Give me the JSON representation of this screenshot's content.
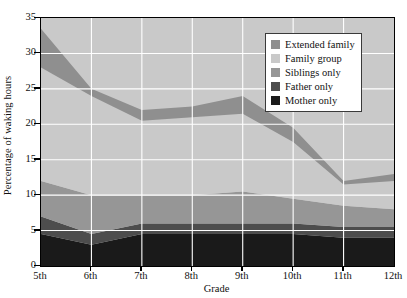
{
  "chart_data": {
    "type": "area",
    "stacked": true,
    "title": "",
    "xlabel": "Grade",
    "ylabel": "Percentage of waking hours",
    "categories": [
      "5th",
      "6th",
      "7th",
      "8th",
      "9th",
      "10th",
      "11th",
      "12th"
    ],
    "ylim": [
      0,
      35
    ],
    "yticks": [
      0,
      5,
      10,
      15,
      20,
      25,
      30,
      35
    ],
    "grid": true,
    "grid_color": "#ffffff",
    "plot_background": "#c9c9c9",
    "legend_position": "top-right",
    "series": [
      {
        "name": "Mother only",
        "color": "#1a1a1a",
        "values": [
          4.5,
          3.0,
          4.5,
          4.5,
          4.5,
          4.5,
          4.0,
          4.0
        ]
      },
      {
        "name": "Father only",
        "color": "#4d4d4d",
        "values": [
          2.5,
          1.5,
          1.5,
          1.5,
          1.5,
          1.5,
          1.5,
          1.5
        ]
      },
      {
        "name": "Siblings only",
        "color": "#969696",
        "values": [
          5.0,
          5.5,
          4.0,
          4.0,
          4.5,
          3.5,
          3.0,
          2.5
        ]
      },
      {
        "name": "Family group",
        "color": "#c9c9c9",
        "values": [
          16.0,
          14.0,
          10.5,
          11.0,
          11.0,
          8.0,
          3.0,
          4.0
        ]
      },
      {
        "name": "Extended family",
        "color": "#8f8f8f",
        "values": [
          5.5,
          1.0,
          1.5,
          1.5,
          2.5,
          2.0,
          0.5,
          1.0
        ]
      }
    ],
    "cumulative_tops": {
      "Mother only": [
        4.5,
        3.0,
        4.5,
        4.5,
        4.5,
        4.5,
        4.0,
        4.0
      ],
      "Father only": [
        7.0,
        4.5,
        6.0,
        6.0,
        6.0,
        6.0,
        5.5,
        5.5
      ],
      "Siblings only": [
        12.0,
        10.0,
        10.0,
        10.0,
        10.5,
        9.5,
        8.5,
        8.0
      ],
      "Family group": [
        28.0,
        24.0,
        20.5,
        21.0,
        21.5,
        17.5,
        11.5,
        12.0
      ],
      "Extended family": [
        33.5,
        25.0,
        22.0,
        22.5,
        24.0,
        19.5,
        12.0,
        13.0
      ]
    }
  },
  "legend": {
    "items": [
      {
        "label": "Extended family",
        "color": "#8f8f8f"
      },
      {
        "label": "Family group",
        "color": "#c9c9c9"
      },
      {
        "label": "Siblings only",
        "color": "#969696"
      },
      {
        "label": "Father only",
        "color": "#4d4d4d"
      },
      {
        "label": "Mother only",
        "color": "#1a1a1a"
      }
    ]
  },
  "axes": {
    "y_title": "Percentage of waking hours",
    "x_title": "Grade",
    "y_tick_labels": [
      "35",
      "30",
      "25",
      "20",
      "15",
      "10",
      "5",
      "0"
    ],
    "x_tick_labels": [
      "5th",
      "6th",
      "7th",
      "8th",
      "9th",
      "10th",
      "11th",
      "12th"
    ]
  }
}
